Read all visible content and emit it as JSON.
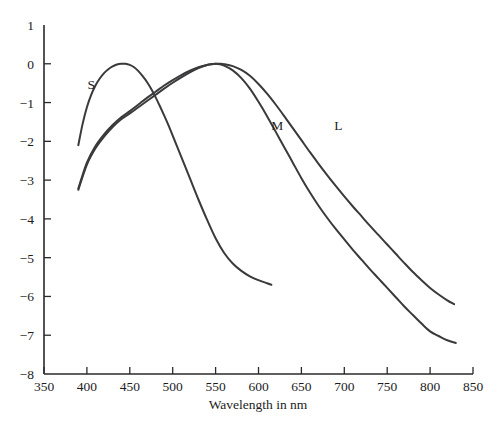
{
  "chart_data": {
    "type": "line",
    "title": "",
    "xlabel": "Wavelength in nm",
    "ylabel": "",
    "xlim": [
      350,
      850
    ],
    "ylim": [
      -8,
      1
    ],
    "xticks": [
      350,
      400,
      450,
      500,
      550,
      600,
      650,
      700,
      750,
      800,
      850
    ],
    "yticks": [
      1,
      0,
      -1,
      -2,
      -3,
      -4,
      -5,
      -6,
      -7,
      -8
    ],
    "xtick_labels": [
      "350",
      "400",
      "450",
      "500",
      "550",
      "600",
      "650",
      "700",
      "750",
      "800",
      "850"
    ],
    "ytick_labels": [
      "1",
      "0",
      "−1",
      "−2",
      "−3",
      "−4",
      "−5",
      "−6",
      "−7",
      "−8"
    ],
    "grid": false,
    "legend": "inline-curve-labels",
    "annotations": [
      {
        "text": "S",
        "x": 405,
        "y": -0.65
      },
      {
        "text": "M",
        "x": 622,
        "y": -1.72
      },
      {
        "text": "L",
        "x": 693,
        "y": -1.72
      }
    ],
    "series": [
      {
        "name": "S",
        "label": "S",
        "color": "#3a3a3c",
        "points": [
          [
            390,
            -2.1
          ],
          [
            395,
            -1.55
          ],
          [
            400,
            -1.12
          ],
          [
            405,
            -0.8
          ],
          [
            410,
            -0.56
          ],
          [
            415,
            -0.38
          ],
          [
            420,
            -0.24
          ],
          [
            425,
            -0.14
          ],
          [
            430,
            -0.07
          ],
          [
            435,
            -0.02
          ],
          [
            440,
            0.0
          ],
          [
            445,
            0.0
          ],
          [
            450,
            -0.03
          ],
          [
            455,
            -0.09
          ],
          [
            460,
            -0.19
          ],
          [
            465,
            -0.32
          ],
          [
            470,
            -0.47
          ],
          [
            475,
            -0.65
          ],
          [
            480,
            -0.86
          ],
          [
            485,
            -1.09
          ],
          [
            490,
            -1.33
          ],
          [
            495,
            -1.58
          ],
          [
            500,
            -1.85
          ],
          [
            510,
            -2.4
          ],
          [
            520,
            -2.95
          ],
          [
            530,
            -3.5
          ],
          [
            540,
            -4.02
          ],
          [
            550,
            -4.5
          ],
          [
            560,
            -4.88
          ],
          [
            570,
            -5.15
          ],
          [
            580,
            -5.34
          ],
          [
            590,
            -5.48
          ],
          [
            600,
            -5.58
          ],
          [
            610,
            -5.66
          ],
          [
            615,
            -5.7
          ]
        ]
      },
      {
        "name": "M",
        "label": "M",
        "color": "#3a3a3c",
        "points": [
          [
            390,
            -3.25
          ],
          [
            400,
            -2.6
          ],
          [
            410,
            -2.18
          ],
          [
            420,
            -1.88
          ],
          [
            430,
            -1.63
          ],
          [
            440,
            -1.43
          ],
          [
            450,
            -1.28
          ],
          [
            460,
            -1.12
          ],
          [
            470,
            -0.96
          ],
          [
            480,
            -0.8
          ],
          [
            490,
            -0.64
          ],
          [
            500,
            -0.49
          ],
          [
            510,
            -0.35
          ],
          [
            520,
            -0.22
          ],
          [
            530,
            -0.11
          ],
          [
            540,
            -0.03
          ],
          [
            545,
            -0.01
          ],
          [
            550,
            0.0
          ],
          [
            555,
            -0.01
          ],
          [
            560,
            -0.05
          ],
          [
            570,
            -0.17
          ],
          [
            580,
            -0.37
          ],
          [
            590,
            -0.64
          ],
          [
            600,
            -0.98
          ],
          [
            610,
            -1.35
          ],
          [
            620,
            -1.75
          ],
          [
            630,
            -2.15
          ],
          [
            640,
            -2.55
          ],
          [
            650,
            -2.95
          ],
          [
            660,
            -3.32
          ],
          [
            670,
            -3.66
          ],
          [
            680,
            -3.97
          ],
          [
            690,
            -4.26
          ],
          [
            700,
            -4.53
          ],
          [
            710,
            -4.8
          ],
          [
            720,
            -5.05
          ],
          [
            730,
            -5.3
          ],
          [
            740,
            -5.54
          ],
          [
            750,
            -5.78
          ],
          [
            760,
            -6.02
          ],
          [
            770,
            -6.26
          ],
          [
            780,
            -6.48
          ],
          [
            790,
            -6.7
          ],
          [
            800,
            -6.9
          ],
          [
            810,
            -7.02
          ],
          [
            820,
            -7.13
          ],
          [
            830,
            -7.2
          ]
        ]
      },
      {
        "name": "L",
        "label": "L",
        "color": "#3a3a3c",
        "points": [
          [
            390,
            -3.22
          ],
          [
            400,
            -2.55
          ],
          [
            410,
            -2.12
          ],
          [
            420,
            -1.82
          ],
          [
            430,
            -1.58
          ],
          [
            440,
            -1.38
          ],
          [
            450,
            -1.22
          ],
          [
            460,
            -1.05
          ],
          [
            470,
            -0.88
          ],
          [
            480,
            -0.72
          ],
          [
            490,
            -0.56
          ],
          [
            500,
            -0.42
          ],
          [
            510,
            -0.29
          ],
          [
            520,
            -0.18
          ],
          [
            530,
            -0.09
          ],
          [
            540,
            -0.03
          ],
          [
            550,
            0.0
          ],
          [
            555,
            0.0
          ],
          [
            560,
            -0.01
          ],
          [
            570,
            -0.06
          ],
          [
            580,
            -0.16
          ],
          [
            590,
            -0.31
          ],
          [
            600,
            -0.52
          ],
          [
            610,
            -0.77
          ],
          [
            620,
            -1.05
          ],
          [
            630,
            -1.35
          ],
          [
            640,
            -1.66
          ],
          [
            650,
            -1.97
          ],
          [
            660,
            -2.28
          ],
          [
            670,
            -2.58
          ],
          [
            680,
            -2.87
          ],
          [
            690,
            -3.15
          ],
          [
            700,
            -3.42
          ],
          [
            710,
            -3.68
          ],
          [
            720,
            -3.93
          ],
          [
            730,
            -4.18
          ],
          [
            740,
            -4.42
          ],
          [
            750,
            -4.66
          ],
          [
            760,
            -4.9
          ],
          [
            770,
            -5.14
          ],
          [
            780,
            -5.37
          ],
          [
            790,
            -5.58
          ],
          [
            800,
            -5.78
          ],
          [
            810,
            -5.95
          ],
          [
            820,
            -6.1
          ],
          [
            828,
            -6.2
          ]
        ]
      }
    ]
  }
}
